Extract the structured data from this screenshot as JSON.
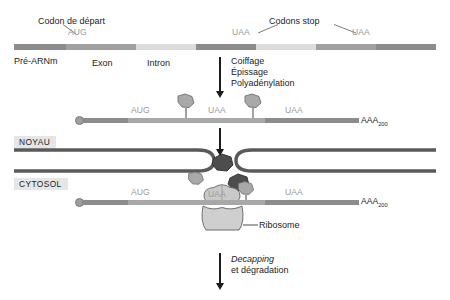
{
  "figure": {
    "language": "fr"
  },
  "colors": {
    "exon_dark": "#8c8c8c",
    "exon_mid": "#a8a8a8",
    "intron_light": "#dcdcdc",
    "utr_dark": "#7a7a7a",
    "codon_grey_text": "#9a9a9a",
    "text_black": "#1c1c1c",
    "chip_bg": "#e6e6e6",
    "envelope": "#5a5a5a",
    "ejc_fill": "#a9a9a9",
    "factor_dark": "#4d4d4d",
    "ribosome_fill": "#c9c9c9",
    "cap_fill": "#9e9e9e"
  },
  "annotations": {
    "start_codon_label": "Codon de départ",
    "stop_codons_label": "Codons stop",
    "start_codon": "AUG",
    "stop_codon": "UAA",
    "premrna_label": "Pré-ARNm",
    "exon_label": "Exon",
    "intron_label": "Intron",
    "poly_a": "AAA",
    "poly_a_subscript": "200",
    "ribosome_label": "Ribosome",
    "nucleus_label": "NOYAU",
    "cytosol_label": "CYTOSOL"
  },
  "steps": {
    "processing": {
      "lines": [
        "Coiffage",
        "Épissage",
        "Polyadénylation"
      ]
    },
    "decay": {
      "line_italic": "Decapping",
      "line_plain": "et dégradation"
    }
  },
  "stage1": {
    "name": "pré-ARNm",
    "codons": [
      {
        "text": "AUG",
        "x": 68,
        "y": 28
      },
      {
        "text": "UAA",
        "x": 232,
        "y": 28
      },
      {
        "text": "UAA",
        "x": 352,
        "y": 28
      }
    ],
    "segments": [
      {
        "kind": "utr",
        "x": 14,
        "w": 52,
        "color": "#8c8c8c"
      },
      {
        "kind": "exon",
        "x": 66,
        "w": 70,
        "color": "#a0a0a0"
      },
      {
        "kind": "intron",
        "x": 136,
        "w": 60,
        "color": "#dcdcdc"
      },
      {
        "kind": "exon",
        "x": 196,
        "w": 60,
        "color": "#8c8c8c"
      },
      {
        "kind": "intron",
        "x": 256,
        "w": 60,
        "color": "#dcdcdc"
      },
      {
        "kind": "exon",
        "x": 316,
        "w": 60,
        "color": "#a0a0a0"
      },
      {
        "kind": "utr",
        "x": 376,
        "w": 60,
        "color": "#8c8c8c"
      }
    ]
  },
  "stage2": {
    "name": "ARNm mature (noyau)",
    "codons": [
      {
        "text": "AUG",
        "x": 131,
        "y": 106
      },
      {
        "text": "UAA",
        "x": 208,
        "y": 106
      },
      {
        "text": "UAA",
        "x": 285,
        "y": 106
      }
    ],
    "ejc_markers": [
      {
        "x": 186,
        "label": "complexe de jonction d'exons"
      },
      {
        "x": 253,
        "label": "complexe de jonction d'exons"
      }
    ],
    "segments": [
      {
        "kind": "utr",
        "x": 82,
        "w": 46,
        "color": "#8c8c8c"
      },
      {
        "kind": "cds",
        "x": 128,
        "w": 137,
        "color": "#a8a8a8"
      },
      {
        "kind": "utr",
        "x": 265,
        "w": 94,
        "color": "#8c8c8c"
      }
    ]
  },
  "stage3": {
    "name": "ARNm en traduction (cytosol)",
    "codons": [
      {
        "text": "AUG",
        "x": 131,
        "y": 188
      },
      {
        "text": "UAA",
        "x": 208,
        "y": 190
      },
      {
        "text": "UAA",
        "x": 285,
        "y": 188
      }
    ],
    "segments": [
      {
        "kind": "utr",
        "x": 82,
        "w": 46,
        "color": "#8c8c8c"
      },
      {
        "kind": "cds",
        "x": 128,
        "w": 137,
        "color": "#a8a8a8"
      },
      {
        "kind": "utr",
        "x": 265,
        "w": 94,
        "color": "#8c8c8c"
      }
    ]
  }
}
